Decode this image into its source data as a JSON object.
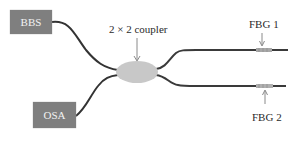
{
  "diagram": {
    "nodes": {
      "source": {
        "label": "BBS"
      },
      "analyzer": {
        "label": "OSA"
      },
      "coupler": {
        "label": "2 × 2 coupler"
      },
      "grating1": {
        "label": "FBG 1"
      },
      "grating2": {
        "label": "FBG 2"
      }
    },
    "colors": {
      "box_fill": "#7f7f7f",
      "fiber": "#333333",
      "coupler_fill": "#c8c8c8",
      "grating": "#a8a8a8",
      "arrow": "#8a8a8a"
    }
  }
}
